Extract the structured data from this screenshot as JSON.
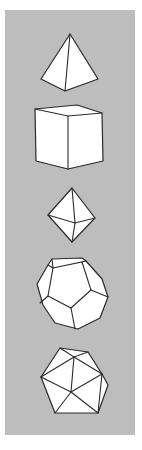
{
  "figure": {
    "title": "",
    "panel_color": "#bdbdbd",
    "line_color": "#2a2a2a",
    "fill_color": "#ffffff",
    "solids": [
      {
        "name": "tetrahedron",
        "faces": 4
      },
      {
        "name": "cube",
        "faces": 6
      },
      {
        "name": "octahedron",
        "faces": 8
      },
      {
        "name": "dodecahedron",
        "faces": 12
      },
      {
        "name": "icosahedron",
        "faces": 20
      }
    ]
  }
}
